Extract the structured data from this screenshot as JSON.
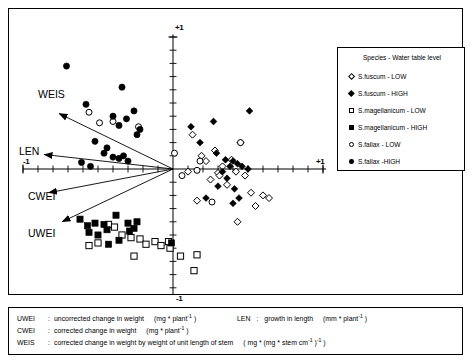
{
  "figure": {
    "kind": "ordination-biplot",
    "axes": {
      "x_pos_label": "+1",
      "x_neg_label": "-1",
      "y_pos_label": "+1",
      "y_neg_label": "-1",
      "xlim": [
        -1,
        1
      ],
      "ylim": [
        -1,
        1
      ],
      "origin": [
        0,
        0
      ],
      "tick_interval": 0.1,
      "grid": false
    }
  },
  "legend": {
    "title": "Species - Water table level",
    "position": "top-right",
    "entries": [
      {
        "marker": "diamond-open",
        "label": "S.fuscum - LOW"
      },
      {
        "marker": "diamond-fill",
        "label": "S.fuscum - HIGH"
      },
      {
        "marker": "square-open",
        "label": "S.magellanicum - LOW"
      },
      {
        "marker": "square-fill",
        "label": "S.magellanicum - HIGH"
      },
      {
        "marker": "circle-open",
        "label": "S.fallax - LOW"
      },
      {
        "marker": "circle-fill",
        "label": "S.fallax -HIGH"
      }
    ]
  },
  "vectors": [
    {
      "name": "WEIS",
      "label": "WEIS",
      "tip": [
        -0.76,
        0.42
      ]
    },
    {
      "name": "LEN",
      "label": "LEN",
      "tip": [
        -0.86,
        0.11
      ]
    },
    {
      "name": "CWEI",
      "label": "CWEI",
      "tip": [
        -0.83,
        -0.18
      ]
    },
    {
      "name": "UWEI",
      "label": "UWEI",
      "tip": [
        -0.74,
        -0.4
      ]
    }
  ],
  "footnotes": {
    "line1_key": "UWEI",
    "line1_sep": ":",
    "line1_desc": "uncorrected change in weight",
    "line1_unit_pre": "(mg * plant",
    "line1_unit_sup": "-1",
    "line1_unit_post": " )",
    "line2_key": "CWEI",
    "line2_sep": ":",
    "line2_desc": "corrected change  in weight",
    "line2_unit_pre": "(mg * plant",
    "line2_unit_sup": "-1",
    "line2_unit_post": " )",
    "line3_key": "WEIS",
    "line3_sep": ":",
    "line3_desc": "corrected  change  in weight by weight of unit length of stem",
    "line3_unit_pre": "( mg * (mg * stem cm",
    "line3_unit_sup1": "-1",
    "line3_unit_mid": "  )",
    "line3_unit_sup2": "-1",
    "line3_unit_post": " )",
    "right_key": "LEN",
    "right_sep": ":",
    "right_desc": "growth in length",
    "right_unit_pre": "(mm * plant",
    "right_unit_sup": "-1",
    "right_unit_post": " )"
  },
  "chart_data": {
    "type": "scatter",
    "title": "",
    "xlabel": "",
    "ylabel": "",
    "xlim": [
      -1,
      1
    ],
    "ylim": [
      -1,
      1
    ],
    "grid": false,
    "legend_position": "top-right",
    "series": [
      {
        "name": "S.fuscum - LOW",
        "marker": "diamond-open",
        "points": [
          [
            0.1,
            -0.02
          ],
          [
            0.13,
            0.26
          ],
          [
            0.16,
            -0.24
          ],
          [
            0.19,
            0.1
          ],
          [
            0.22,
            0.06
          ],
          [
            0.25,
            -0.08
          ],
          [
            0.28,
            0.14
          ],
          [
            0.3,
            -0.03
          ],
          [
            0.33,
            0.02
          ],
          [
            0.36,
            -0.12
          ],
          [
            0.39,
            0.07
          ],
          [
            0.42,
            -0.02
          ],
          [
            0.45,
            0.2
          ],
          [
            0.48,
            -0.05
          ],
          [
            0.52,
            -0.18
          ],
          [
            0.55,
            -0.28
          ],
          [
            0.6,
            -0.2
          ],
          [
            0.64,
            -0.22
          ],
          [
            0.43,
            -0.4
          ],
          [
            0.31,
            -0.05
          ]
        ]
      },
      {
        "name": "S.fuscum - HIGH",
        "marker": "diamond-fill",
        "points": [
          [
            0.12,
            0.32
          ],
          [
            0.27,
            0.36
          ],
          [
            0.51,
            0.44
          ],
          [
            0.18,
            0.2
          ],
          [
            0.29,
            0.12
          ],
          [
            0.35,
            0.07
          ],
          [
            0.4,
            0.06
          ],
          [
            0.43,
            0.04
          ],
          [
            0.46,
            0.02
          ],
          [
            0.5,
            0.0
          ],
          [
            0.33,
            -0.02
          ],
          [
            0.36,
            -0.07
          ],
          [
            0.3,
            -0.13
          ],
          [
            0.41,
            -0.15
          ],
          [
            0.44,
            -0.22
          ],
          [
            0.22,
            -0.22
          ],
          [
            0.4,
            -0.26
          ],
          [
            0.38,
            0.02
          ]
        ]
      },
      {
        "name": "S.magellanicum - LOW",
        "marker": "square-open",
        "points": [
          [
            -0.43,
            -0.42
          ],
          [
            -0.39,
            -0.44
          ],
          [
            -0.34,
            -0.5
          ],
          [
            -0.28,
            -0.52
          ],
          [
            -0.22,
            -0.53
          ],
          [
            -0.18,
            -0.57
          ],
          [
            -0.12,
            -0.55
          ],
          [
            -0.08,
            -0.58
          ],
          [
            -0.03,
            -0.55
          ],
          [
            -0.26,
            -0.66
          ],
          [
            0.05,
            -0.66
          ],
          [
            0.16,
            -0.65
          ],
          [
            0.14,
            -0.77
          ],
          [
            -0.5,
            -0.56
          ],
          [
            -0.56,
            -0.58
          ],
          [
            -0.02,
            -0.6
          ]
        ]
      },
      {
        "name": "S.magellanicum - HIGH",
        "marker": "square-fill",
        "points": [
          [
            -0.62,
            -0.38
          ],
          [
            -0.52,
            -0.41
          ],
          [
            -0.46,
            -0.42
          ],
          [
            -0.44,
            -0.46
          ],
          [
            -0.56,
            -0.48
          ],
          [
            -0.5,
            -0.5
          ],
          [
            -0.38,
            -0.35
          ],
          [
            -0.3,
            -0.41
          ],
          [
            -0.26,
            -0.45
          ],
          [
            -0.24,
            -0.4
          ],
          [
            -0.36,
            -0.54
          ],
          [
            -0.43,
            -0.57
          ],
          [
            -0.01,
            -0.56
          ],
          [
            -0.57,
            -0.43
          ],
          [
            -0.29,
            -0.47
          ]
        ]
      },
      {
        "name": "S.fallax - LOW",
        "marker": "circle-open",
        "points": [
          [
            -0.56,
            0.43
          ],
          [
            -0.4,
            0.36
          ],
          [
            -0.23,
            0.32
          ],
          [
            0.01,
            0.12
          ],
          [
            -0.49,
            0.35
          ],
          [
            0.16,
            -0.01
          ],
          [
            0.45,
            0.2
          ],
          [
            0.06,
            -0.05
          ],
          [
            0.26,
            -0.25
          ],
          [
            0.18,
            0.06
          ]
        ]
      },
      {
        "name": "S.fallax -HIGH",
        "marker": "circle-fill",
        "points": [
          [
            -0.71,
            0.78
          ],
          [
            -0.34,
            0.62
          ],
          [
            -0.58,
            0.49
          ],
          [
            -0.4,
            0.4
          ],
          [
            -0.31,
            0.38
          ],
          [
            -0.36,
            0.33
          ],
          [
            -0.22,
            0.3
          ],
          [
            -0.26,
            0.44
          ],
          [
            -0.52,
            0.21
          ],
          [
            -0.46,
            0.12
          ],
          [
            -0.4,
            0.09
          ],
          [
            -0.36,
            0.08
          ],
          [
            -0.33,
            0.1
          ],
          [
            -0.3,
            0.06
          ],
          [
            -0.55,
            0.02
          ],
          [
            -0.61,
            0.05
          ],
          [
            -0.44,
            0.16
          ],
          [
            -0.24,
            0.26
          ]
        ]
      }
    ]
  }
}
